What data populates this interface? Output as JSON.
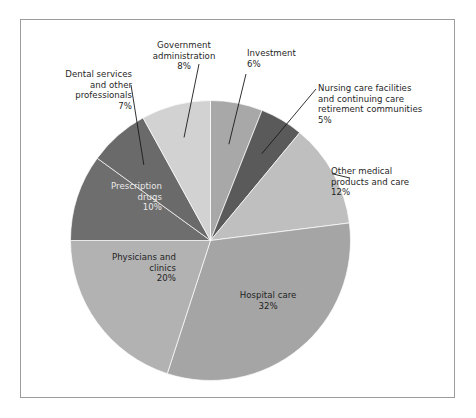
{
  "figure": {
    "frame_border_color": "#9c9c9c",
    "background_color": "#ffffff"
  },
  "chart_data": {
    "type": "pie",
    "title": "",
    "subtitle": "",
    "xlabel": "",
    "ylabel": "",
    "grid": false,
    "legend_position": "none",
    "units": "percent",
    "total": 100,
    "start_angle_deg": 0,
    "direction": "clockwise",
    "categories": [
      "Investment",
      "Nursing care facilities and continuing care retirement communities",
      "Other medical products and care",
      "Hospital care",
      "Physicians and clinics",
      "Prescription drugs",
      "Dental services and other professionals",
      "Government administration"
    ],
    "values": [
      6,
      5,
      12,
      32,
      20,
      10,
      7,
      8
    ],
    "slices": [
      {
        "label": "Investment",
        "value": 6,
        "value_text": "6%",
        "color": "#a8a8a8",
        "label_placement": "outside",
        "label_align": "center",
        "leader_line": true
      },
      {
        "label": "Nursing care facilities\nand continuing care\nretirement communities",
        "value": 5,
        "value_text": "5%",
        "color": "#5a5a5a",
        "label_placement": "outside",
        "label_align": "left",
        "leader_line": true
      },
      {
        "label": "Other medical\nproducts and care",
        "value": 12,
        "value_text": "12%",
        "color": "#bfbfbf",
        "label_placement": "outside",
        "label_align": "right",
        "leader_line": true
      },
      {
        "label": "Hospital care",
        "value": 32,
        "value_text": "32%",
        "color": "#a5a5a5",
        "label_placement": "inside",
        "label_align": "center",
        "leader_line": false
      },
      {
        "label": "Physicians and\nclinics",
        "value": 20,
        "value_text": "20%",
        "color": "#b2b2b2",
        "label_placement": "inside",
        "label_align": "right",
        "leader_line": false
      },
      {
        "label": "Prescription\ndrugs",
        "value": 10,
        "value_text": "10%",
        "color": "#6e6e6e",
        "label_placement": "inside",
        "label_align": "right",
        "leader_line": false
      },
      {
        "label": "Dental services\nand other\nprofessionals",
        "value": 7,
        "value_text": "7%",
        "color": "#6a6a6a",
        "label_placement": "outside",
        "label_align": "right",
        "leader_line": true
      },
      {
        "label": "Government\nadministration",
        "value": 8,
        "value_text": "8%",
        "color": "#d2d2d2",
        "label_placement": "outside",
        "label_align": "center",
        "leader_line": true
      }
    ]
  },
  "labels": {
    "dental": {
      "text": "Dental services\nand other\nprofessionals",
      "pct": "7%"
    },
    "government": {
      "text": "Government\nadministration",
      "pct": "8%"
    },
    "investment": {
      "text": "Investment",
      "pct": "6%"
    },
    "nursing": {
      "text": "Nursing care facilities\nand continuing care\nretirement communities",
      "pct": "5%"
    },
    "other_medical": {
      "text": "Other medical\nproducts and care",
      "pct": "12%"
    },
    "prescription": {
      "text": "Prescription\ndrugs",
      "pct": "10%"
    },
    "physicians": {
      "text": "Physicians and\nclinics",
      "pct": "20%"
    },
    "hospital": {
      "text": "Hospital care",
      "pct": "32%"
    }
  }
}
